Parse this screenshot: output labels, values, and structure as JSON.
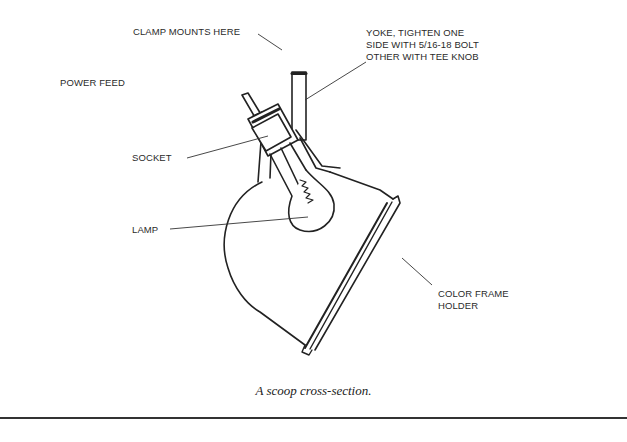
{
  "figure": {
    "caption": "A scoop cross-section.",
    "labels": {
      "clamp": "CLAMP MOUNTS HERE",
      "yoke_line1": "YOKE, TIGHTEN ONE",
      "yoke_line2": "SIDE WITH 5/16-18 BOLT",
      "yoke_line3": "OTHER WITH TEE KNOB",
      "power_feed": "POWER  FEED",
      "socket": "SOCKET",
      "lamp": "LAMP",
      "color_frame_line1": "COLOR FRAME",
      "color_frame_line2": "HOLDER"
    },
    "colors": {
      "ink": "#222222",
      "background": "#ffffff"
    }
  }
}
